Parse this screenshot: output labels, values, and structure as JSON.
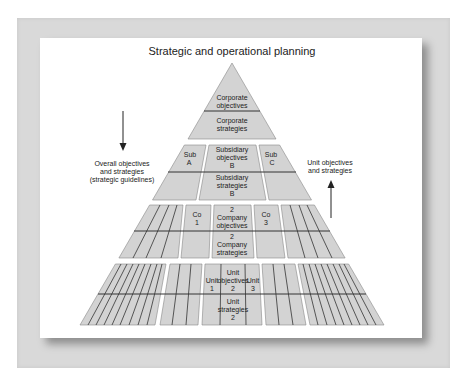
{
  "title": "Strategic and operational planning",
  "left_note": {
    "lines": [
      "Overall objectives",
      "and strategies",
      "(strategic guidelines)"
    ],
    "arrow": "down-arrow"
  },
  "right_note": {
    "lines": [
      "Unit objectives",
      "and strategies"
    ],
    "arrow": "up-arrow"
  },
  "tier1": {
    "top": [
      "Corporate",
      "objectives"
    ],
    "bottom": [
      "Corporate",
      "strategies"
    ]
  },
  "tier2": {
    "left": [
      "Sub",
      "A"
    ],
    "center_top": [
      "Subsidiary",
      "objectives",
      "B"
    ],
    "center_bottom": [
      "Subsidiary",
      "strategies",
      "B"
    ],
    "right": [
      "Sub",
      "C"
    ]
  },
  "tier3": {
    "left": [
      "Co",
      "1"
    ],
    "center_top": [
      "2",
      "Company",
      "objectives"
    ],
    "center_bottom": [
      "2",
      "Company",
      "strategies"
    ],
    "right": [
      "Co",
      "3"
    ]
  },
  "tier4": {
    "left": [
      "Unit",
      "1"
    ],
    "center_top": [
      "Unit",
      "objectives",
      "2"
    ],
    "right": [
      "Unit",
      "3"
    ],
    "center_bottom": [
      "Unit",
      "strategies",
      "2"
    ]
  },
  "colors": {
    "fill": "#d3d3d3",
    "line": "#333333",
    "frame": "#d9d9d9"
  }
}
